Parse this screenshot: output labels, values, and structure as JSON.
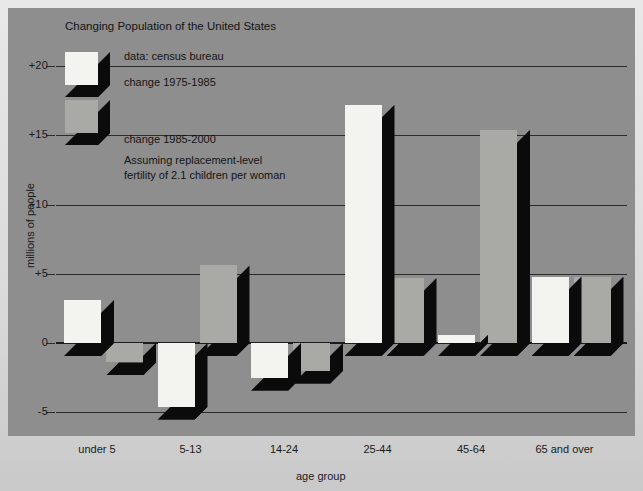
{
  "figure": {
    "title": "Changing Population of the United States",
    "source_note": "data: census bureau",
    "footnote_line1": "Assuming replacement-level",
    "footnote_line2": "fertility of 2.1 children per woman",
    "panel_color": "#8e8e8e",
    "series_a_color": "#f3f3f0",
    "series_b_color": "#a9a9a6",
    "shadow_color": "#0b0b0b"
  },
  "legend": {
    "position": "top-left",
    "entries": [
      {
        "label": "change 1975-1985",
        "swatch": "white-3d-block"
      },
      {
        "label": "change 1985-2000",
        "swatch": "gray-3d-block"
      }
    ]
  },
  "chart_data": {
    "type": "bar",
    "title": "Changing Population of the United States",
    "xlabel": "age group",
    "ylabel": "millions of people",
    "categories": [
      "under 5",
      "5-13",
      "14-24",
      "25-44",
      "45-64",
      "65 and over"
    ],
    "series": [
      {
        "name": "change 1975-1985",
        "values": [
          3.1,
          -4.6,
          -2.5,
          17.2,
          0.6,
          4.8
        ]
      },
      {
        "name": "change 1985-2000",
        "values": [
          -1.4,
          5.6,
          -2.0,
          4.7,
          15.4,
          4.8
        ]
      }
    ],
    "ylim": [
      -6.5,
      22
    ],
    "yticks": [
      20,
      15,
      10,
      5,
      0,
      -5
    ],
    "ytick_labels": [
      "+20",
      "+15",
      "+10",
      "+5",
      "0",
      "-5"
    ],
    "grid": "horizontal",
    "legend_position": "top-left",
    "annotations": [
      "data: census bureau",
      "Assuming replacement-level fertility of 2.1 children per woman"
    ]
  }
}
